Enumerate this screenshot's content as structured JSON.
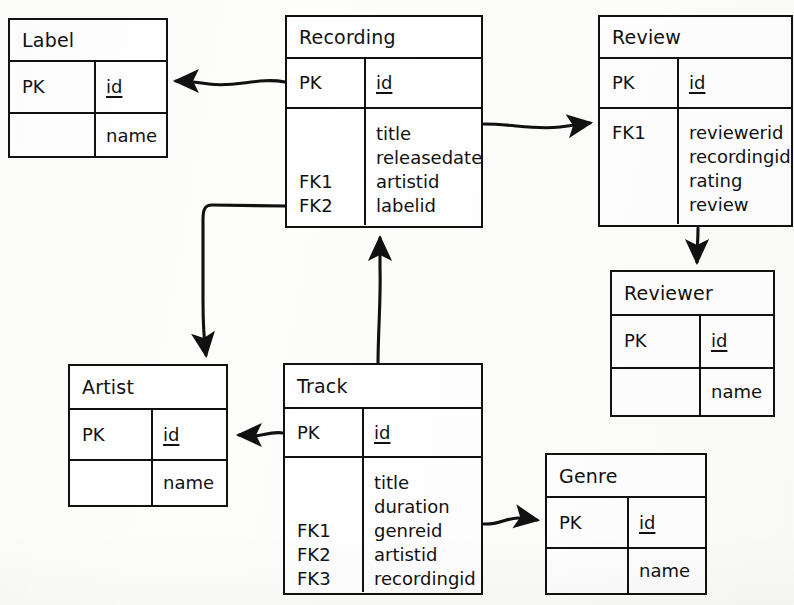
{
  "diagram": {
    "style": "hand-drawn crow's-foot-free ER diagram, black ink on white paper",
    "line_color": "#111111",
    "background_color": "#ffffff",
    "entities": [
      {
        "id": "label",
        "name": "Label",
        "key_label": "PK",
        "key_attribute": "id",
        "attributes": [
          {
            "key": "",
            "name": "name"
          }
        ]
      },
      {
        "id": "recording",
        "name": "Recording",
        "key_label": "PK",
        "key_attribute": "id",
        "attributes": [
          {
            "key": "",
            "name": "title"
          },
          {
            "key": "",
            "name": "releasedate"
          },
          {
            "key": "FK1",
            "name": "artistid"
          },
          {
            "key": "FK2",
            "name": "labelid"
          }
        ]
      },
      {
        "id": "review",
        "name": "Review",
        "key_label": "PK",
        "key_attribute": "id",
        "attributes": [
          {
            "key": "FK1",
            "name": "reviewerid"
          },
          {
            "key": "",
            "name": "recordingid"
          },
          {
            "key": "",
            "name": "rating"
          },
          {
            "key": "",
            "name": "review"
          }
        ]
      },
      {
        "id": "reviewer",
        "name": "Reviewer",
        "key_label": "PK",
        "key_attribute": "id",
        "attributes": [
          {
            "key": "",
            "name": "name"
          }
        ]
      },
      {
        "id": "artist",
        "name": "Artist",
        "key_label": "PK",
        "key_attribute": "id",
        "attributes": [
          {
            "key": "",
            "name": "name"
          }
        ]
      },
      {
        "id": "track",
        "name": "Track",
        "key_label": "PK",
        "key_attribute": "id",
        "attributes": [
          {
            "key": "",
            "name": "title"
          },
          {
            "key": "",
            "name": "duration"
          },
          {
            "key": "FK1",
            "name": "genreid"
          },
          {
            "key": "FK2",
            "name": "artistid"
          },
          {
            "key": "FK3",
            "name": "recordingid"
          }
        ]
      },
      {
        "id": "genre",
        "name": "Genre",
        "key_label": "PK",
        "key_attribute": "id",
        "attributes": [
          {
            "key": "",
            "name": "name"
          }
        ]
      }
    ],
    "relationships": [
      {
        "id": "recording-to-label",
        "from": "Recording",
        "to": "Label",
        "direction": "left"
      },
      {
        "id": "recording-to-review",
        "from": "Recording",
        "to": "Review",
        "direction": "right"
      },
      {
        "id": "review-to-reviewer",
        "from": "Review",
        "to": "Reviewer",
        "direction": "down"
      },
      {
        "id": "recording-to-artist",
        "from": "Recording",
        "to": "Artist",
        "direction": "left-down"
      },
      {
        "id": "track-to-recording",
        "from": "Track",
        "to": "Recording",
        "direction": "up"
      },
      {
        "id": "track-to-artist",
        "from": "Track",
        "to": "Artist",
        "direction": "left"
      },
      {
        "id": "track-to-genre",
        "from": "Track",
        "to": "Genre",
        "direction": "right"
      }
    ]
  }
}
